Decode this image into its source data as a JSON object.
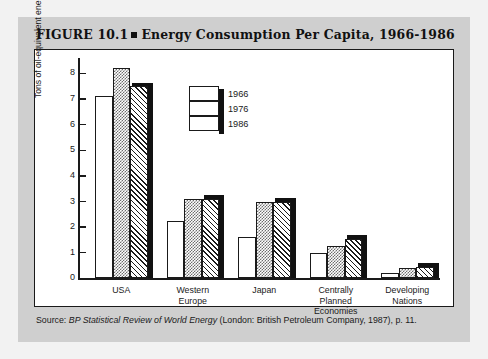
{
  "figure": {
    "label": "FIGURE 10.1",
    "title": "Energy Consumption Per Capita, 1966-1986",
    "source_prefix": "Source:",
    "source_italic": "BP Statistical Review of World Energy",
    "source_rest": "(London: British Petroleum Company, 1987), p. 11."
  },
  "chart_data": {
    "type": "bar",
    "title": "Energy Consumption Per Capita, 1966-1986",
    "xlabel": "",
    "ylabel": "Tons of oil-equivalent energy",
    "ylim": [
      0,
      8.6
    ],
    "yticks": [
      0,
      1,
      2,
      3,
      4,
      5,
      6,
      7,
      8
    ],
    "grid": false,
    "legend_position": "top-center",
    "categories": [
      "USA",
      "Western Europe",
      "Japan",
      "Centrally Planned Economies",
      "Developing Nations"
    ],
    "category_lines": [
      [
        "USA"
      ],
      [
        "Western",
        "Europe"
      ],
      [
        "Japan"
      ],
      [
        "Centrally",
        "Planned",
        "Economies"
      ],
      [
        "Developing",
        "Nations"
      ]
    ],
    "series": [
      {
        "name": "1966",
        "fill": "white",
        "values": [
          7.1,
          2.25,
          1.6,
          1.0,
          0.2
        ]
      },
      {
        "name": "1976",
        "fill": "checkerboard",
        "values": [
          8.2,
          3.1,
          3.0,
          1.25,
          0.4
        ]
      },
      {
        "name": "1986",
        "fill": "diagonal-hatch",
        "values": [
          7.5,
          3.1,
          3.0,
          1.55,
          0.45
        ]
      }
    ]
  },
  "colors": {
    "page_background": "#f2f2f2",
    "figure_background": "#cfcfcf",
    "plot_background": "#ffffff",
    "ink": "#1a1a1a",
    "shadow": "#111111"
  }
}
